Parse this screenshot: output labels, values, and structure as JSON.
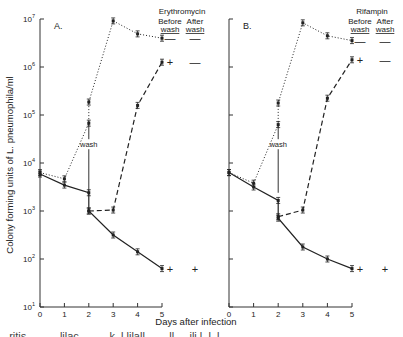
{
  "figure": {
    "ylabel": "Colony forming units of L. pneumophila/ml",
    "xlabel": "Days after infection",
    "wash_label": "wash",
    "before_label": "Before",
    "after_label": "After",
    "wash_col_label": "wash",
    "caption_partial": "...ritis ......  ...lilac..  ...  ...k..l lilall  ...  ...ll  ....ili.l..l..l.."
  },
  "chart_data": [
    {
      "type": "line",
      "panel": "A.",
      "title": "Erythromycin",
      "xlabel": "Days after infection",
      "ylabel": "Colony forming units of L. pneumophila/ml",
      "yscale": "log",
      "ylim": [
        10,
        10000000
      ],
      "yticks": [
        "10^1",
        "10^2",
        "10^3",
        "10^4",
        "10^5",
        "10^6",
        "10^7"
      ],
      "xticks": [
        0,
        1,
        2,
        3,
        4,
        5
      ],
      "grid": false,
      "series": [
        {
          "name": "dotted (antibiotic removed, wash day 2 upper)",
          "style": "dotted",
          "x": [
            0,
            1,
            2,
            2,
            3,
            4,
            5
          ],
          "log10_y": [
            3.8,
            3.67,
            4.83,
            5.27,
            6.96,
            6.69,
            6.6
          ]
        },
        {
          "name": "dashed (after wash)",
          "style": "dashed",
          "x": [
            2,
            3,
            4,
            5
          ],
          "log10_y": [
            3.0,
            3.02,
            5.2,
            6.1
          ]
        },
        {
          "name": "solid (antibiotic continued)",
          "style": "solid",
          "x": [
            0,
            1,
            2,
            2,
            3,
            4,
            5
          ],
          "log10_y": [
            3.77,
            3.54,
            3.38,
            3.0,
            2.5,
            2.15,
            1.8
          ]
        }
      ],
      "legend": {
        "header": [
          "Before wash",
          "After wash"
        ],
        "rows": [
          {
            "series": "dotted",
            "before": "—",
            "after": "—"
          },
          {
            "series": "dashed",
            "before": "+",
            "after": "—"
          },
          {
            "series": "solid",
            "before": "+",
            "after": "+"
          }
        ]
      },
      "annotations": [
        "wash"
      ]
    },
    {
      "type": "line",
      "panel": "B.",
      "title": "Rifampin",
      "xlabel": "Days after infection",
      "yscale": "log",
      "ylim": [
        10,
        10000000
      ],
      "xticks": [
        0,
        1,
        2,
        3,
        4,
        5
      ],
      "grid": false,
      "series": [
        {
          "name": "dotted",
          "style": "dotted",
          "x": [
            0,
            1,
            2,
            2,
            3,
            4,
            5
          ],
          "log10_y": [
            3.8,
            3.58,
            4.8,
            5.25,
            6.92,
            6.65,
            6.55
          ]
        },
        {
          "name": "dashed",
          "style": "dashed",
          "x": [
            2,
            3,
            4,
            5
          ],
          "log10_y": [
            2.88,
            3.02,
            5.35,
            6.15
          ]
        },
        {
          "name": "solid",
          "style": "solid",
          "x": [
            0,
            1,
            2,
            2,
            3,
            4,
            5
          ],
          "log10_y": [
            3.8,
            3.5,
            3.22,
            2.85,
            2.25,
            2.0,
            1.8
          ]
        }
      ],
      "legend": {
        "header": [
          "Before wash",
          "After wash"
        ],
        "rows": [
          {
            "series": "dotted",
            "before": "—",
            "after": "—"
          },
          {
            "series": "dashed",
            "before": "+",
            "after": "—"
          },
          {
            "series": "solid",
            "before": "+",
            "after": "+"
          }
        ]
      },
      "annotations": [
        "wash"
      ]
    }
  ]
}
